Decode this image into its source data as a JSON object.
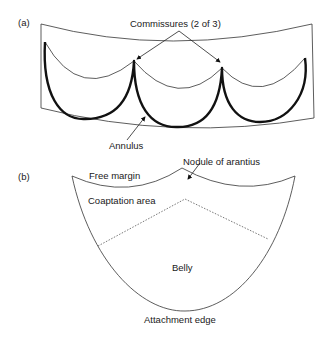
{
  "figure": {
    "panel_a": {
      "label": "(a)",
      "annotations": {
        "commissures": "Commissures (2 of 3)",
        "annulus": "Annulus"
      }
    },
    "panel_b": {
      "label": "(b)",
      "annotations": {
        "free_margin": "Free margin",
        "nodule": "Nodule of arantius",
        "coaptation_area": "Coaptation area",
        "belly": "Belly",
        "attachment_edge": "Attachment edge"
      }
    }
  }
}
